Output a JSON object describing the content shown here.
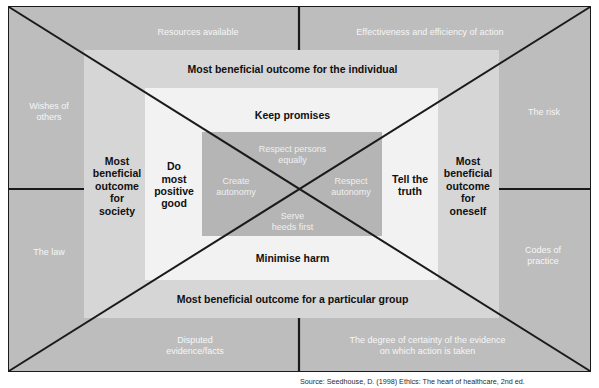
{
  "diagram": {
    "colors": {
      "frame_background": "#bdbdbd",
      "layer1_background": "#d6d6d6",
      "layer2_background": "#f2f2f2",
      "layer3_background": "#b5b5b5",
      "line": "#1a1a1a",
      "dark_text": "#101010",
      "light_text": "#f7f7f7"
    },
    "outer_ring": {
      "top_left": "Resources available",
      "top_right": "Effectiveness and efficiency of action",
      "left_upper": "Wishes of\nothers",
      "left_lower": "The law",
      "right_upper": "The risk",
      "right_lower": "Codes of\npractice",
      "bottom_left": "Disputed\nevidence/facts",
      "bottom_right": "The degree of certainty of the evidence\non which action is taken"
    },
    "layer1": {
      "top": "Most beneficial outcome for the individual",
      "bottom": "Most beneficial outcome for a particular group",
      "left": "Most\nbeneficial\noutcome\nfor\nsociety",
      "right": "Most\nbeneficial\noutcome\nfor\noneself"
    },
    "layer2": {
      "top": "Keep promises",
      "bottom": "Minimise harm",
      "left": "Do\nmost\npositive\ngood",
      "right": "Tell the\ntruth"
    },
    "layer3": {
      "top": "Respect persons\nequally",
      "bottom": "Serve\nheeds first",
      "left": "Create\nautonomy",
      "right": "Respect\nautonomy"
    },
    "caption": "Source: Seedhouse, D. (1998) Ethics: The heart of healthcare, 2nd ed."
  }
}
